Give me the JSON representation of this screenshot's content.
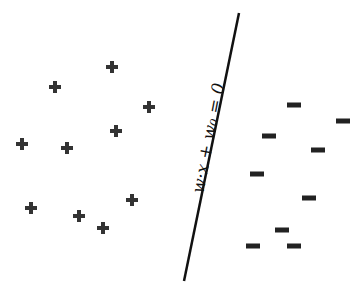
{
  "diagram": {
    "type": "linear-separator",
    "boundary_label": "w·x + w₀ = 0",
    "boundary_line": {
      "x1": 239,
      "y1": 13,
      "x2": 184,
      "y2": 281,
      "color": "#111111"
    },
    "positive_class": {
      "symbol": "+",
      "color": "#333333",
      "points": [
        [
          112,
          67
        ],
        [
          55,
          87
        ],
        [
          149,
          107
        ],
        [
          116,
          131
        ],
        [
          22,
          144
        ],
        [
          67,
          148
        ],
        [
          132,
          200
        ],
        [
          31,
          208
        ],
        [
          79,
          216
        ],
        [
          103,
          228
        ]
      ]
    },
    "negative_class": {
      "symbol": "−",
      "color": "#222222",
      "points": [
        [
          294,
          105
        ],
        [
          343,
          121
        ],
        [
          269,
          136
        ],
        [
          318,
          150
        ],
        [
          257,
          174
        ],
        [
          309,
          198
        ],
        [
          282,
          230
        ],
        [
          253,
          246
        ],
        [
          294,
          246
        ]
      ]
    }
  }
}
